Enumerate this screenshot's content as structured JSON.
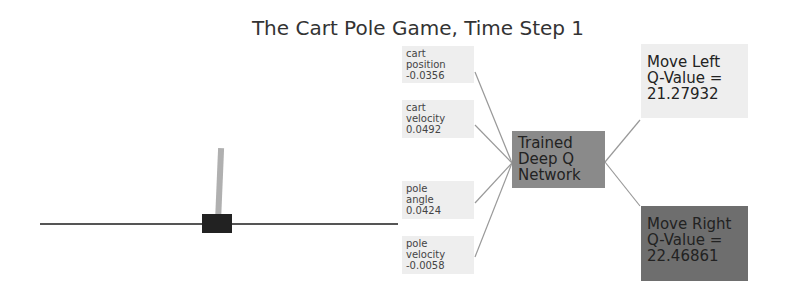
{
  "title": "The Cart Pole Game, Time Step 1",
  "inputs": [
    {
      "label": "cart position",
      "line1": "cart",
      "line2": "position",
      "value": "-0.0356"
    },
    {
      "label": "cart velocity",
      "line1": "cart",
      "line2": "velocity",
      "value": "0.0492"
    },
    {
      "label": "pole angle",
      "line1": "pole",
      "line2": "angle",
      "value": "0.0424"
    },
    {
      "label": "pole velocity",
      "line1": "pole",
      "line2": "velocity",
      "value": "-0.0058"
    }
  ],
  "network": {
    "line1": "Trained",
    "line2": "Deep Q",
    "line3": "Network"
  },
  "outputs": {
    "left": {
      "line1": "Move Left",
      "line2": "Q-Value =",
      "value": "21.27932"
    },
    "right": {
      "line1": "Move Right",
      "line2": "Q-Value =",
      "value": "22.46861"
    }
  },
  "colors": {
    "input_box": "#eeeeee",
    "network_box": "#8a8a8a",
    "left_output": "#eeeeee",
    "right_output": "#6e6e6e",
    "cart": "#222222",
    "pole": "#b0b0b0"
  }
}
